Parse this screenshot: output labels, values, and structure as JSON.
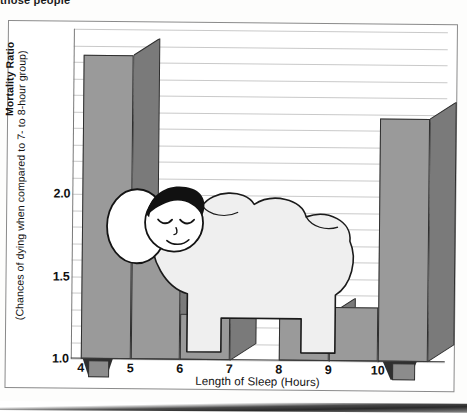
{
  "page": {
    "top_caption": "those people"
  },
  "chart_data": {
    "type": "bar",
    "title": "",
    "xlabel": "Length of Sleep (Hours)",
    "ylabel": "Mortality Ratio",
    "ylabel_sub": "(Chances of dying when compared to 7- to 8-hour group)",
    "categories": [
      "4",
      "5",
      "6",
      "7",
      "8",
      "9",
      "10"
    ],
    "values": [
      2.84,
      1.63,
      1.28,
      1.0,
      1.28,
      1.33,
      2.47
    ],
    "ylim": [
      1.0,
      3.0
    ],
    "yticks": [
      1.0,
      1.5,
      2.0
    ],
    "ytick_labels": [
      "1.0",
      "1.5",
      "2.0"
    ],
    "xticks": [
      4,
      5,
      6,
      7,
      8,
      9,
      10
    ],
    "grid": true,
    "gridlines": [
      1.0,
      1.1,
      1.2,
      1.3,
      1.4,
      1.5,
      1.6,
      1.7,
      1.8,
      1.9,
      2.0,
      2.1,
      2.2,
      2.3,
      2.4,
      2.5,
      2.6,
      2.7,
      2.8,
      2.9,
      3.0
    ],
    "legend": [],
    "annotations": [
      "sleeping-person-illustration"
    ],
    "style": "3d-bar-with-illustration",
    "bar_color": "#9a9a9a",
    "bar_side_color": "#6f6f6f",
    "grid_color": "#c9c9c9"
  },
  "illustration": {
    "name": "sleeping person in bed",
    "parts": [
      "pillow",
      "head",
      "hair",
      "closed-eyes",
      "smile",
      "blanket",
      "bed-legs"
    ],
    "blanket_color": "#efefef",
    "hair_color": "#111111",
    "skin_color": "#ffffff"
  }
}
